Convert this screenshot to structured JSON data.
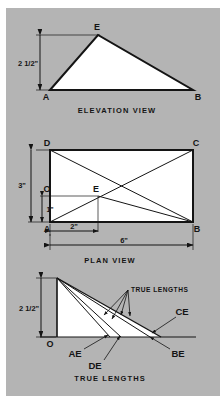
{
  "plate": {
    "background_color": "#b4b4b4",
    "page_color": "#ffffff",
    "ink_color": "#141414",
    "fill_color": "#ffffff"
  },
  "elevation": {
    "caption": "ELEVATION VIEW",
    "dimension_height": "2 1/2\"",
    "vertices": [
      {
        "label": "A",
        "x": 50,
        "y": 90
      },
      {
        "label": "E",
        "x": 98,
        "y": 35
      },
      {
        "label": "B",
        "x": 193,
        "y": 90
      }
    ]
  },
  "plan": {
    "caption": "PLAN VIEW",
    "dimension_left_full": "3\"",
    "dimension_left_part": "1\"",
    "dimension_bottom_part": "2\"",
    "dimension_bottom_full": "6\"",
    "origin_label": "O",
    "vertices": [
      {
        "label": "D",
        "x": 50,
        "y": 150
      },
      {
        "label": "C",
        "x": 193,
        "y": 150
      },
      {
        "label": "A",
        "x": 50,
        "y": 222
      },
      {
        "label": "B",
        "x": 193,
        "y": 222
      },
      {
        "label": "E",
        "x": 98,
        "y": 196
      }
    ]
  },
  "truelengths": {
    "caption": "TRUE LENGTHS",
    "annotation": "TRUE LENGTHS",
    "dimension_height": "2 1/2\"",
    "origin_label": "O",
    "ray_labels": [
      {
        "label": "AE",
        "x": 75,
        "y": 354
      },
      {
        "label": "DE",
        "x": 95,
        "y": 366
      },
      {
        "label": "BE",
        "x": 174,
        "y": 354
      },
      {
        "label": "CE",
        "x": 180,
        "y": 321
      }
    ],
    "apex": {
      "x": 57,
      "y": 278
    },
    "baseline_y": 337,
    "ray_ends": [
      110,
      121,
      150,
      161
    ]
  }
}
